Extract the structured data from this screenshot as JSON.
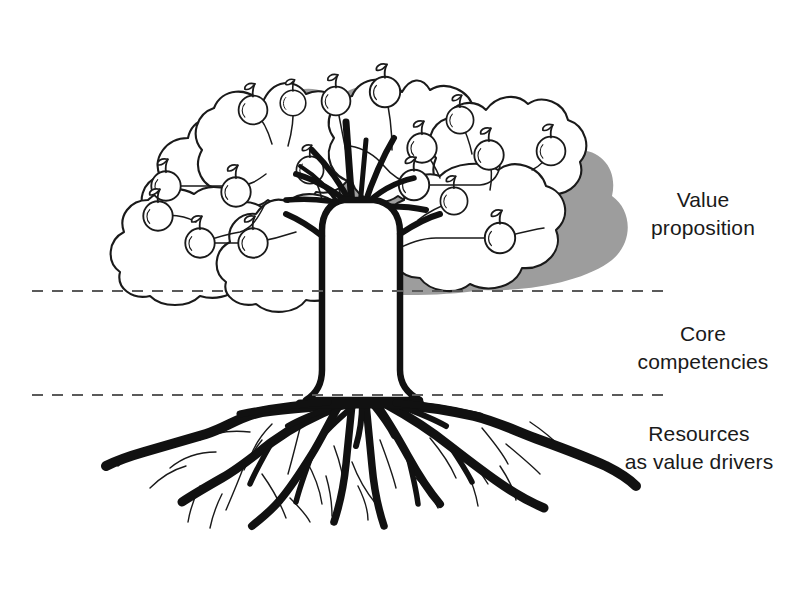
{
  "figure": {
    "type": "diagram",
    "background_color": "#ffffff",
    "ink_color": "#1a1a1a",
    "shadow_color": "#8c8c8c"
  },
  "labels": [
    {
      "id": "value-proposition",
      "text": "Value\nproposition",
      "line1": "Value",
      "line2": "proposition"
    },
    {
      "id": "core-competencies",
      "text": "Core\ncompetencies",
      "line1": "Core",
      "line2": "competencies"
    },
    {
      "id": "resources-as-value-drivers",
      "text": "Resources\nas value drivers",
      "line1": "Resources",
      "line2": "as value drivers"
    }
  ],
  "dividers": [
    {
      "id": "canopy-trunk-divider",
      "y": 291,
      "x_start": 32,
      "x_end": 663,
      "style": "dashed"
    },
    {
      "id": "trunk-root-divider",
      "y": 395,
      "x_start": 32,
      "x_end": 663,
      "style": "dashed"
    }
  ],
  "zones": [
    {
      "id": "canopy-zone",
      "label": "Value proposition",
      "element": "canopy with apples"
    },
    {
      "id": "trunk-zone",
      "label": "Core competencies",
      "element": "trunk"
    },
    {
      "id": "roots-zone",
      "label": "Resources as value drivers",
      "element": "root system"
    }
  ],
  "tree": {
    "apple_count": 17,
    "canopy_lobe_count": 7,
    "trunk": {
      "top_y": 205,
      "base_y": 400,
      "left_x": 327,
      "right_x": 392
    },
    "apples": [
      {
        "cx": 166,
        "cy": 186
      },
      {
        "cx": 158,
        "cy": 216
      },
      {
        "cx": 200,
        "cy": 243
      },
      {
        "cx": 236,
        "cy": 192
      },
      {
        "cx": 253,
        "cy": 243
      },
      {
        "cx": 253,
        "cy": 110
      },
      {
        "cx": 293,
        "cy": 103
      },
      {
        "cx": 336,
        "cy": 101
      },
      {
        "cx": 385,
        "cy": 92
      },
      {
        "cx": 422,
        "cy": 148
      },
      {
        "cx": 414,
        "cy": 185
      },
      {
        "cx": 454,
        "cy": 201
      },
      {
        "cx": 489,
        "cy": 155
      },
      {
        "cx": 500,
        "cy": 238
      },
      {
        "cx": 551,
        "cy": 151
      },
      {
        "cx": 460,
        "cy": 120
      },
      {
        "cx": 310,
        "cy": 170
      }
    ]
  }
}
